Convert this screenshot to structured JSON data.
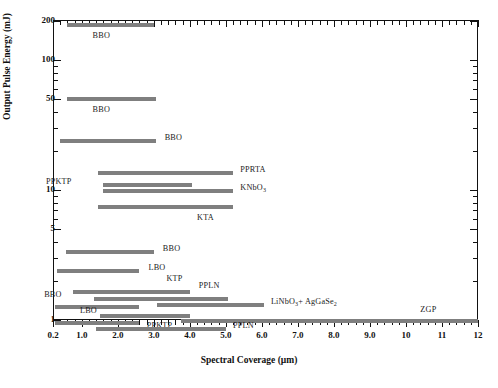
{
  "chart_data": {
    "type": "bar",
    "orientation": "horizontal-range",
    "title": "",
    "xlabel": "Spectral Coverage (µm)",
    "ylabel": "Output Pulse Energy  (mJ)",
    "xscale": "linear",
    "yscale": "log",
    "xlim": [
      0.2,
      12
    ],
    "ylim": [
      0.8,
      230
    ],
    "grid": false,
    "legend": "none",
    "xticks_major": [
      0.2,
      1.0,
      2.0,
      3.0,
      4.0,
      5.0,
      6.0,
      7.0,
      8.0,
      9.0,
      10,
      11,
      12
    ],
    "xtick_labels": [
      "0.2",
      "1.0",
      "2.0",
      "3.0",
      "4.0",
      "5.0",
      "6.0",
      "7.0",
      "8.0",
      "9.0",
      "10",
      "11",
      "12"
    ],
    "yticks_major": [
      200,
      100,
      50,
      10,
      5,
      1
    ],
    "ytick_labels": [
      "200",
      "100",
      "50",
      "10",
      "5",
      "1"
    ],
    "bars": [
      {
        "label": "BBO",
        "x_start": 0.6,
        "x_end": 3.0,
        "y": 185,
        "label_x": 1.3,
        "label_dy": 12
      },
      {
        "label": "BBO",
        "x_start": 0.6,
        "x_end": 3.05,
        "y": 50,
        "label_x": 1.3,
        "label_dy": 12
      },
      {
        "label": "BBO",
        "x_start": 0.4,
        "x_end": 3.05,
        "y": 24,
        "label_x": 3.3,
        "label_dy": -2
      },
      {
        "label": "PPRTA",
        "x_start": 1.45,
        "x_end": 5.2,
        "y": 13.5,
        "label_x": 5.4,
        "label_dy": -2
      },
      {
        "label": "PPKTP",
        "x_start": 1.6,
        "x_end": 4.05,
        "y": 11.0,
        "label_x": 0.95,
        "label_dy": -2,
        "label_align": "right"
      },
      {
        "label": "KNbO3",
        "x_start": 1.6,
        "x_end": 5.2,
        "y": 9.8,
        "label_x": 5.4,
        "label_dy": -2
      },
      {
        "label": "KTA",
        "x_start": 1.45,
        "x_end": 5.2,
        "y": 7.4,
        "label_x": 4.2,
        "label_dy": 12
      },
      {
        "label": "BBO",
        "x_start": 0.55,
        "x_end": 3.0,
        "y": 3.35,
        "label_x": 3.25,
        "label_dy": -2
      },
      {
        "label": "LBO",
        "x_start": 0.3,
        "x_end": 2.6,
        "y": 2.4,
        "label_x": 2.85,
        "label_dy": -2
      },
      {
        "label": "KTP",
        "x_start": 0.75,
        "x_end": 4.0,
        "y": 1.65,
        "label_x": 3.35,
        "label_dy": -12
      },
      {
        "label": "PPLN",
        "x_start": 1.35,
        "x_end": 5.05,
        "y": 1.45,
        "label_x": 4.25,
        "label_dy": -12
      },
      {
        "label": "LiNbO3+ AgGaSe2",
        "x_start": 3.1,
        "x_end": 6.05,
        "y": 1.3,
        "label_x": 6.25,
        "label_dy": -2
      },
      {
        "label": "BBO",
        "x_start": 0.25,
        "x_end": 2.6,
        "y": 1.26,
        "label_x": 0.9,
        "label_dy": -11,
        "label_align": "right"
      },
      {
        "label": "PPKTP",
        "x_start": 1.5,
        "x_end": 4.0,
        "y": 1.08,
        "label_x": 2.8,
        "label_dy": 11
      },
      {
        "label": "ZGP",
        "x_start": 3.75,
        "x_end": 12.0,
        "y": 0.98,
        "label_x": 10.4,
        "label_dy": -10
      },
      {
        "label": "LBO",
        "x_start": 0.25,
        "x_end": 2.6,
        "y": 0.95,
        "label_x": 0.95,
        "label_dy": -11
      },
      {
        "label": "PPLN",
        "x_start": 1.4,
        "x_end": 5.0,
        "y": 0.86,
        "label_x": 5.2,
        "label_dy": -2
      }
    ],
    "series_colors": {
      "bar": "#7f7f7f",
      "axis": "#111111"
    }
  },
  "axes": {
    "x_title": "Spectral Coverage (µm)",
    "y_title": "Output Pulse Energy  (mJ)"
  }
}
